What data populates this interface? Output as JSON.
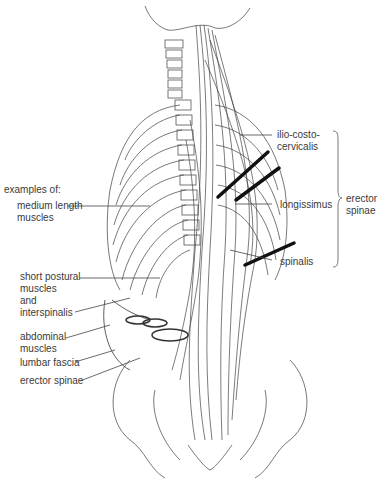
{
  "figure": {
    "left_labels": {
      "heading": "examples of:",
      "medium_length": "medium length\nmuscles",
      "short_postural": "short postural\nmuscles\nand\ninterspinalis",
      "abdominal": "abdominal\nmuscles",
      "lumbar_fascia": "lumbar fascia",
      "erector_spinae": "erector spinae"
    },
    "right_labels": {
      "ilio_costo": "ilio-costo-\ncervicalis",
      "longissimus": "longissimus",
      "spinalis": "spinalis",
      "group": "erector\nspinae"
    }
  }
}
